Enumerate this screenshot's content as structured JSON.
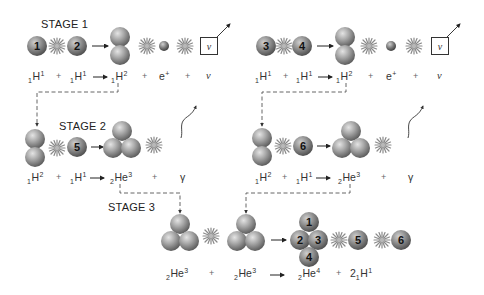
{
  "diagram": {
    "stages": [
      {
        "label": "STAGE 1"
      },
      {
        "label": "STAGE 2"
      },
      {
        "label": "STAGE 3"
      }
    ],
    "protons": {
      "p1": "1",
      "p2": "2",
      "p3": "3",
      "p4": "4",
      "p5": "5",
      "p6": "6"
    },
    "helium_nucleus": [
      "1",
      "2",
      "3",
      "4"
    ],
    "neutrino_symbol": "ν",
    "gamma_symbol": "γ",
    "plus": "+",
    "stage1_equation": {
      "terms": [
        {
          "pre": "1",
          "sym": "H",
          "suf": "1"
        },
        {
          "pre": "1",
          "sym": "H",
          "suf": "1"
        },
        {
          "pre": "1",
          "sym": "H",
          "suf": "2"
        },
        {
          "pre": "",
          "sym": "e",
          "suf": "+"
        },
        {
          "pre": "",
          "sym": "ν",
          "suf": ""
        }
      ]
    },
    "stage2_equation": {
      "terms": [
        {
          "pre": "1",
          "sym": "H",
          "suf": "2"
        },
        {
          "pre": "1",
          "sym": "H",
          "suf": "1"
        },
        {
          "pre": "2",
          "sym": "He",
          "suf": "3"
        },
        {
          "pre": "",
          "sym": "γ",
          "suf": ""
        }
      ]
    },
    "stage3_equation": {
      "terms": [
        {
          "pre": "2",
          "sym": "He",
          "suf": "3"
        },
        {
          "pre": "2",
          "sym": "He",
          "suf": "3"
        },
        {
          "pre": "2",
          "sym": "He",
          "suf": "4"
        },
        {
          "coef": "2",
          "pre": "1",
          "sym": "H",
          "suf": "1"
        }
      ]
    },
    "colors": {
      "sphere_light": "#d6d6d6",
      "sphere_mid": "#9a9a9a",
      "sphere_dark": "#5e5e5e",
      "positron_dark": "#555555",
      "starburst": "#8a8a8a",
      "dashed_line": "#555555",
      "arrow": "#222222"
    }
  }
}
